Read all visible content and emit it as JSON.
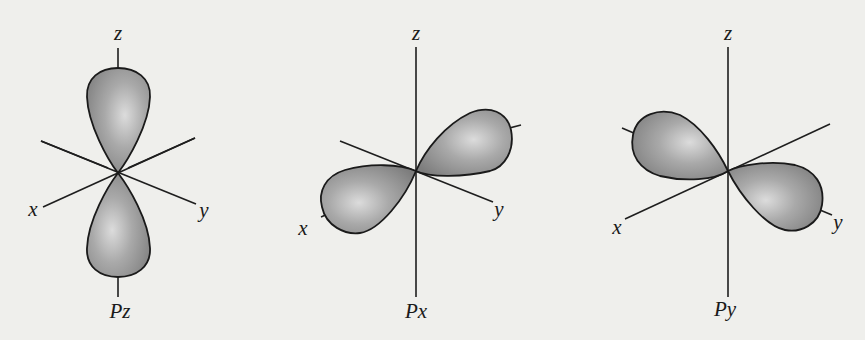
{
  "figure": {
    "background": "#efefec",
    "lobe_color": "#8e8e8e",
    "lobe_highlight": "#d6d6d6"
  },
  "orbitals": [
    {
      "name": "Pz",
      "label": "Pz",
      "axes": {
        "z": "z",
        "x": "x",
        "y": "y"
      },
      "orientation": "along z-axis"
    },
    {
      "name": "Px",
      "label": "Px",
      "axes": {
        "z": "z",
        "x": "x",
        "y": "y"
      },
      "orientation": "along x-axis"
    },
    {
      "name": "Py",
      "label": "Py",
      "axes": {
        "z": "z",
        "x": "x",
        "y": "y"
      },
      "orientation": "along y-axis"
    }
  ]
}
